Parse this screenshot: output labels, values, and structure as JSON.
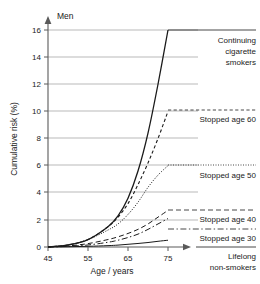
{
  "panel": {
    "label": "Men"
  },
  "axes": {
    "x": {
      "title": "Age / years",
      "ticks": [
        45,
        55,
        65,
        75
      ],
      "tick_labels": [
        "45",
        "55",
        "65",
        "75"
      ],
      "range": [
        45,
        76.5
      ],
      "arrow": true
    },
    "y": {
      "title": "Cumulative risk (%)",
      "ticks": [
        0,
        2,
        4,
        6,
        8,
        10,
        12,
        14,
        16
      ],
      "tick_labels": [
        "0",
        "2",
        "4",
        "6",
        "8",
        "10",
        "12",
        "14",
        "16"
      ],
      "range": [
        0,
        17
      ],
      "arrow": true,
      "grid": true
    }
  },
  "labels": {
    "continuing": [
      "Continuing",
      "cigarette",
      "smokers"
    ],
    "stopped60": "Stopped age 60",
    "stopped50": "Stopped age 50",
    "stopped40": "Stopped age 40",
    "stopped30": "Stopped age 30",
    "lifelong": [
      "Lifelong",
      "non-smokers"
    ]
  },
  "colors": {
    "ink": "#1a1a1a",
    "grid": "#8c8c8c",
    "axis": "#5a5a5a",
    "background": "#ffffff"
  },
  "chart_data": {
    "type": "line",
    "title": "Men",
    "xlabel": "Age / years",
    "ylabel": "Cumulative risk (%)",
    "xlim": [
      45,
      76.5
    ],
    "ylim": [
      0,
      17
    ],
    "grid": true,
    "legend_position": "right-inline-annotations",
    "x": [
      45,
      50,
      55,
      60,
      62.5,
      65,
      67.5,
      70,
      72.5,
      75
    ],
    "series": [
      {
        "name": "Continuing cigarette smokers",
        "label": "Continuing cigarette smokers",
        "style": "solid",
        "values": [
          0,
          0.15,
          0.55,
          1.5,
          2.3,
          3.6,
          5.6,
          8.4,
          12.0,
          16.0
        ],
        "end_value": 16.0
      },
      {
        "name": "Stopped age 60",
        "label": "Stopped age 60",
        "style": "dashed",
        "values": [
          0,
          0.15,
          0.55,
          1.5,
          2.2,
          3.2,
          4.6,
          6.2,
          8.0,
          10.0
        ],
        "end_value": 10.0
      },
      {
        "name": "Stopped age 50",
        "label": "Stopped age 50",
        "style": "dotted",
        "values": [
          0,
          0.15,
          0.55,
          1.25,
          1.7,
          2.4,
          3.3,
          4.4,
          5.3,
          6.0
        ],
        "end_value": 6.0
      },
      {
        "name": "Stopped age 40",
        "label": "Stopped age 40",
        "style": "dashed-long",
        "values": [
          0,
          0.08,
          0.25,
          0.55,
          0.75,
          1.0,
          1.3,
          1.7,
          2.2,
          2.7
        ],
        "end_value": 2.7
      },
      {
        "name": "Stopped age 30",
        "label": "Stopped age 30",
        "style": "dash-dot",
        "values": [
          0,
          0.05,
          0.15,
          0.35,
          0.5,
          0.7,
          0.95,
          1.3,
          1.7,
          2.1
        ],
        "end_value": 2.1
      },
      {
        "name": "Lifelong non-smokers",
        "label": "Lifelong non-smokers",
        "style": "solid-thin",
        "values": [
          0,
          0.02,
          0.05,
          0.1,
          0.14,
          0.2,
          0.26,
          0.33,
          0.42,
          0.5
        ],
        "end_value": 0.5
      }
    ]
  }
}
